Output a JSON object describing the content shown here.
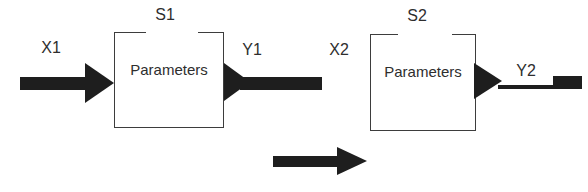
{
  "figure": {
    "background_color": "#ffffff",
    "line_color": "#3d3d3d",
    "arrow_color": "#1e1e1e",
    "text_color": "#2e2e2e",
    "stage1": {
      "system_label": "S1",
      "input_label": "X1",
      "output_label": "Y1",
      "box_label": "Parameters"
    },
    "stage2": {
      "system_label": "S2",
      "input_label": "X2",
      "output_label": "Y2",
      "box_label": "Parameters"
    }
  }
}
